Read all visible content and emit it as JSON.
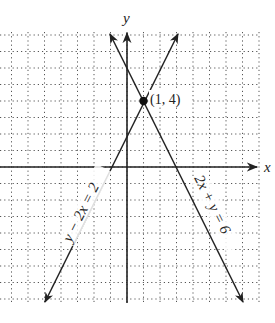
{
  "chart_data": {
    "type": "line",
    "title": "",
    "xlabel": "x",
    "ylabel": "y",
    "grid": true,
    "grid_style": "dotted",
    "xlim": [
      -7.7,
      7.9
    ],
    "ylim": [
      -8.2,
      8.2
    ],
    "series": [
      {
        "name": "y − 2x = 2",
        "equation": "y = 2x + 2",
        "x": [
          -5.1,
          -1,
          0,
          1,
          3.1
        ],
        "y": [
          -8.2,
          0,
          2,
          4,
          8.2
        ]
      },
      {
        "name": "2x + y = 6",
        "equation": "y = -2x + 6",
        "x": [
          -1.1,
          0,
          1,
          3,
          7.1
        ],
        "y": [
          8.2,
          6,
          4,
          0,
          -8.2
        ]
      }
    ],
    "annotations": [
      {
        "text": "(1, 4)",
        "x": 1,
        "y": 4,
        "marker": "filled-circle"
      }
    ]
  },
  "labels": {
    "x_axis": "x",
    "y_axis": "y",
    "line1": "y − 2x = 2",
    "line2": "2x + y = 6",
    "point": "(1, 4)"
  },
  "colors": {
    "grid": "#555555",
    "axes": "#222222",
    "lines": "#222222"
  }
}
